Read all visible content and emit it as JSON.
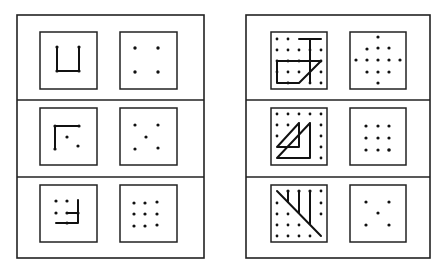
{
  "figure": {
    "colors": {
      "ink": "#111111",
      "background": "#ffffff"
    },
    "panels": [
      {
        "id": "left-panel",
        "rows": [
          {
            "pattern": "U-shape connecting 4 dots",
            "target": "2x2 dot square"
          },
          {
            "pattern": "L-corner with 2 loose dots",
            "target": "5 dots in quincunx"
          },
          {
            "pattern": "Partial 3x3 grid with hooked path",
            "target": "3x3 dot grid"
          }
        ]
      },
      {
        "id": "right-panel",
        "rows": [
          {
            "pattern": "5x5 grid with T-shape and trapezoid",
            "target": "Diamond of 13 dots"
          },
          {
            "pattern": "5x5 grid with two overlapping triangles",
            "target": "3x3 dot grid"
          },
          {
            "pattern": "5x5 grid with diagonal and three vertical strokes",
            "target": "5 dots in quincunx"
          }
        ]
      }
    ]
  }
}
